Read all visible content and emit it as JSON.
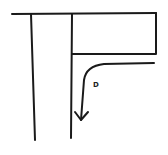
{
  "diagram": {
    "type": "road-junction-sketch",
    "stroke_color": "#1a1a1a",
    "background": "#ffffff",
    "label_movement": "D",
    "elements": [
      {
        "name": "top-road-edge",
        "description": "horizontal line across top"
      },
      {
        "name": "left-road-edge",
        "description": "left vertical road edge"
      },
      {
        "name": "inner-road-edge",
        "description": "right vertical road edge continuing into side road"
      },
      {
        "name": "side-road-box",
        "description": "rectangular side-road outline to the right"
      },
      {
        "name": "turn-arrow",
        "description": "curved arrow turning from right side road down into vertical road",
        "label": "D"
      }
    ]
  }
}
